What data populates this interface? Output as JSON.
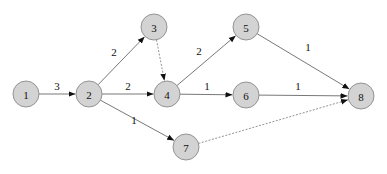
{
  "diagram": {
    "type": "directed-graph",
    "colors": {
      "node_fill": "#d3d3d3",
      "node_stroke": "#8a8a8a",
      "edge": "#555555",
      "edge_dashed": "#777777",
      "text": "#111111"
    },
    "node_radius": 13,
    "nodes": [
      {
        "id": "1",
        "label": "1",
        "x": 26,
        "y": 94
      },
      {
        "id": "2",
        "label": "2",
        "x": 89,
        "y": 94
      },
      {
        "id": "3",
        "label": "3",
        "x": 154,
        "y": 27
      },
      {
        "id": "4",
        "label": "4",
        "x": 167,
        "y": 94
      },
      {
        "id": "5",
        "label": "5",
        "x": 246,
        "y": 27
      },
      {
        "id": "6",
        "label": "6",
        "x": 246,
        "y": 95
      },
      {
        "id": "7",
        "label": "7",
        "x": 186,
        "y": 147
      },
      {
        "id": "8",
        "label": "8",
        "x": 361,
        "y": 96
      }
    ],
    "edges": [
      {
        "from": "1",
        "to": "2",
        "label": "3",
        "style": "solid",
        "lx": 57,
        "ly": 86
      },
      {
        "from": "2",
        "to": "3",
        "label": "2",
        "style": "solid",
        "lx": 114,
        "ly": 52
      },
      {
        "from": "2",
        "to": "4",
        "label": "2",
        "style": "solid",
        "lx": 128,
        "ly": 86
      },
      {
        "from": "2",
        "to": "7",
        "label": "1",
        "style": "solid",
        "lx": 134,
        "ly": 120
      },
      {
        "from": "3",
        "to": "4",
        "label": "",
        "style": "dashed",
        "lx": 0,
        "ly": 0
      },
      {
        "from": "4",
        "to": "5",
        "label": "2",
        "style": "solid",
        "lx": 199,
        "ly": 51
      },
      {
        "from": "4",
        "to": "6",
        "label": "1",
        "style": "solid",
        "lx": 207,
        "ly": 86
      },
      {
        "from": "5",
        "to": "8",
        "label": "1",
        "style": "solid",
        "lx": 308,
        "ly": 47
      },
      {
        "from": "6",
        "to": "8",
        "label": "1",
        "style": "solid",
        "lx": 298,
        "ly": 86
      },
      {
        "from": "7",
        "to": "8",
        "label": "",
        "style": "dashed",
        "lx": 0,
        "ly": 0
      }
    ]
  }
}
